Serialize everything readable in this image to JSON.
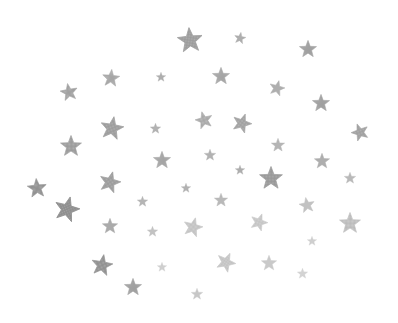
{
  "scene": {
    "description": "Scattered glittery silver stars on white background",
    "background": "#ffffff",
    "stars": [
      {
        "x": 190,
        "y": 40,
        "size": 26,
        "rot": -5,
        "color": "#9a9a9a"
      },
      {
        "x": 240,
        "y": 38,
        "size": 12,
        "rot": 10,
        "color": "#a8a8a8"
      },
      {
        "x": 308,
        "y": 49,
        "size": 18,
        "rot": 0,
        "color": "#9e9e9e"
      },
      {
        "x": 111,
        "y": 78,
        "size": 18,
        "rot": 5,
        "color": "#a4a4a4"
      },
      {
        "x": 161,
        "y": 77,
        "size": 10,
        "rot": 0,
        "color": "#a8a8a8"
      },
      {
        "x": 221,
        "y": 76,
        "size": 18,
        "rot": 0,
        "color": "#a4a4a4"
      },
      {
        "x": 69,
        "y": 92,
        "size": 18,
        "rot": -10,
        "color": "#9e9e9e"
      },
      {
        "x": 277,
        "y": 88,
        "size": 16,
        "rot": 15,
        "color": "#a8a8a8"
      },
      {
        "x": 321,
        "y": 103,
        "size": 18,
        "rot": 0,
        "color": "#9e9e9e"
      },
      {
        "x": 112,
        "y": 128,
        "size": 24,
        "rot": 10,
        "color": "#9a9a9a"
      },
      {
        "x": 155,
        "y": 128,
        "size": 11,
        "rot": 0,
        "color": "#acacac"
      },
      {
        "x": 204,
        "y": 120,
        "size": 18,
        "rot": -15,
        "color": "#a8a8a8"
      },
      {
        "x": 242,
        "y": 123,
        "size": 20,
        "rot": 20,
        "color": "#a0a0a0"
      },
      {
        "x": 360,
        "y": 132,
        "size": 18,
        "rot": -20,
        "color": "#9e9e9e"
      },
      {
        "x": 71,
        "y": 146,
        "size": 22,
        "rot": 0,
        "color": "#9a9a9a"
      },
      {
        "x": 278,
        "y": 145,
        "size": 14,
        "rot": 0,
        "color": "#b0b0b0"
      },
      {
        "x": 162,
        "y": 160,
        "size": 18,
        "rot": 0,
        "color": "#a4a4a4"
      },
      {
        "x": 210,
        "y": 155,
        "size": 12,
        "rot": 0,
        "color": "#acacac"
      },
      {
        "x": 322,
        "y": 161,
        "size": 16,
        "rot": 0,
        "color": "#a8a8a8"
      },
      {
        "x": 37,
        "y": 188,
        "size": 20,
        "rot": -5,
        "color": "#8e8e8e"
      },
      {
        "x": 110,
        "y": 182,
        "size": 22,
        "rot": 15,
        "color": "#9a9a9a"
      },
      {
        "x": 240,
        "y": 170,
        "size": 10,
        "rot": 0,
        "color": "#a8a8a8"
      },
      {
        "x": 271,
        "y": 178,
        "size": 24,
        "rot": 0,
        "color": "#969696"
      },
      {
        "x": 350,
        "y": 178,
        "size": 12,
        "rot": 0,
        "color": "#b4b4b4"
      },
      {
        "x": 186,
        "y": 188,
        "size": 10,
        "rot": 0,
        "color": "#acacac"
      },
      {
        "x": 67,
        "y": 209,
        "size": 26,
        "rot": 15,
        "color": "#8a8a8a"
      },
      {
        "x": 142,
        "y": 201,
        "size": 11,
        "rot": 0,
        "color": "#b0b0b0"
      },
      {
        "x": 221,
        "y": 200,
        "size": 14,
        "rot": 0,
        "color": "#b4b4b4"
      },
      {
        "x": 307,
        "y": 205,
        "size": 16,
        "rot": -10,
        "color": "#bdbdbd"
      },
      {
        "x": 110,
        "y": 226,
        "size": 16,
        "rot": 0,
        "color": "#a4a4a4"
      },
      {
        "x": 152,
        "y": 231,
        "size": 11,
        "rot": 0,
        "color": "#bdbdbd"
      },
      {
        "x": 193,
        "y": 227,
        "size": 20,
        "rot": 15,
        "color": "#c4c4c4"
      },
      {
        "x": 259,
        "y": 222,
        "size": 18,
        "rot": 20,
        "color": "#c6c6c6"
      },
      {
        "x": 350,
        "y": 223,
        "size": 22,
        "rot": 0,
        "color": "#bdbdbd"
      },
      {
        "x": 312,
        "y": 241,
        "size": 10,
        "rot": 0,
        "color": "#cccccc"
      },
      {
        "x": 102,
        "y": 265,
        "size": 22,
        "rot": 10,
        "color": "#8e8e8e"
      },
      {
        "x": 226,
        "y": 262,
        "size": 20,
        "rot": 25,
        "color": "#c4c4c4"
      },
      {
        "x": 269,
        "y": 263,
        "size": 16,
        "rot": 0,
        "color": "#c6c6c6"
      },
      {
        "x": 162,
        "y": 267,
        "size": 10,
        "rot": 0,
        "color": "#cccccc"
      },
      {
        "x": 302,
        "y": 273,
        "size": 11,
        "rot": 0,
        "color": "#d0d0d0"
      },
      {
        "x": 133,
        "y": 287,
        "size": 18,
        "rot": 0,
        "color": "#9e9e9e"
      },
      {
        "x": 197,
        "y": 294,
        "size": 12,
        "rot": 0,
        "color": "#c4c4c4"
      }
    ]
  }
}
